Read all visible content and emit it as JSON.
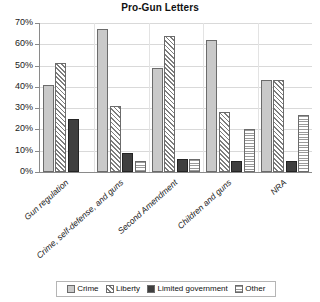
{
  "chart_data": {
    "type": "bar",
    "title": "Pro-Gun Letters",
    "xlabel": "",
    "ylabel": "",
    "ylim": [
      0,
      70
    ],
    "ytick_labels": [
      "0%",
      "10%",
      "20%",
      "30%",
      "40%",
      "50%",
      "60%",
      "70%"
    ],
    "ytick_values": [
      0,
      10,
      20,
      30,
      40,
      50,
      60,
      70
    ],
    "grid": true,
    "legend_position": "bottom",
    "categories": [
      "Gun regulation",
      "Crime, self-defense, and guns",
      "Second Amendment",
      "Children and guns",
      "NRA"
    ],
    "series": [
      {
        "name": "Crime",
        "values": [
          41,
          67,
          49,
          62,
          43
        ]
      },
      {
        "name": "Liberty",
        "values": [
          51,
          31,
          64,
          28,
          43
        ]
      },
      {
        "name": "Limited government",
        "values": [
          25,
          9,
          6,
          5,
          5
        ]
      },
      {
        "name": "Other",
        "values": [
          0,
          5,
          6,
          20,
          27
        ]
      }
    ]
  },
  "legend": {
    "items": [
      {
        "label": "Crime"
      },
      {
        "label": "Liberty"
      },
      {
        "label": "Limited government"
      },
      {
        "label": "Other"
      }
    ]
  }
}
